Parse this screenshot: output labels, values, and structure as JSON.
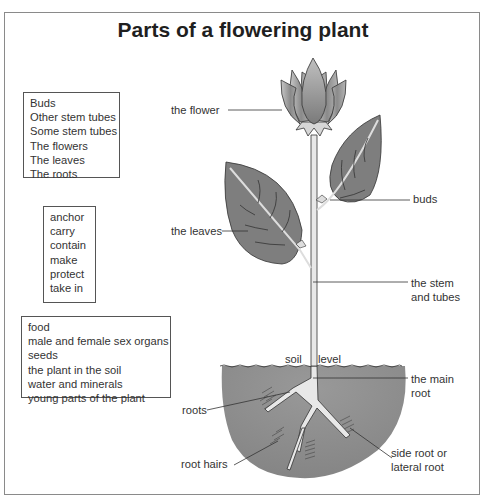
{
  "title": "Parts of a flowering plant",
  "word_boxes": {
    "parts": [
      "Buds",
      "Other stem tubes",
      "Some stem tubes",
      "The flowers",
      "The leaves",
      "The roots"
    ],
    "verbs": [
      "anchor",
      "carry",
      "contain",
      "make",
      "protect",
      "take in"
    ],
    "objects": [
      "food",
      "male and female sex organs",
      "seeds",
      "the plant in the soil",
      "water and minerals",
      "young parts of the plant"
    ]
  },
  "labels": {
    "flower": "the flower",
    "buds": "buds",
    "leaves": "the leaves",
    "stem_line1": "the stem",
    "stem_line2": "and tubes",
    "soil": "soil",
    "level": "level",
    "main_root_line1": "the main",
    "main_root_line2": "root",
    "roots": "roots",
    "root_hairs": "root hairs",
    "side_root_line1": "side root or",
    "side_root_line2": "lateral root"
  },
  "colors": {
    "soil": "#8c8c8c",
    "leaf": "#7e7e7e",
    "stem": "#e6e6e6",
    "outline": "#3a3a3a"
  }
}
